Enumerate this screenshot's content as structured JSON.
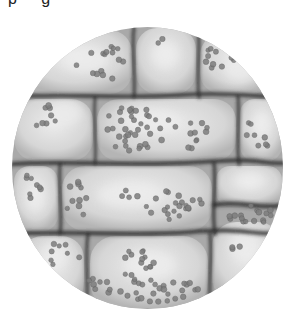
{
  "caption_remnant": "p g",
  "image": {
    "subject": "micrograph of plant leaf cells with chloroplasts",
    "view": "circular microscope field",
    "field": {
      "cx": 147.5,
      "cy": 168,
      "rx": 135.5,
      "ry": 141
    },
    "colors": {
      "background": "#ffffff",
      "cytoplasm": "#a9a9a9",
      "cell_interior": "#d6d6d6",
      "cell_highlight": "#ececec",
      "wall": "#2e2e2e",
      "chloroplast": "#7d7d7d",
      "chloroplast_edge": "#5e5e5e"
    },
    "cells": [
      {
        "x": 20,
        "y": 30,
        "w": 112,
        "h": 64,
        "glow": [
          85,
          60
        ]
      },
      {
        "x": 136,
        "y": 28,
        "w": 60,
        "h": 66,
        "glow": [
          165,
          55
        ]
      },
      {
        "x": 200,
        "y": 34,
        "w": 72,
        "h": 60,
        "glow": [
          240,
          70
        ]
      },
      {
        "x": 14,
        "y": 99,
        "w": 79,
        "h": 62,
        "glow": [
          65,
          113
        ]
      },
      {
        "x": 97,
        "y": 99,
        "w": 139,
        "h": 62,
        "glow": [
          150,
          120
        ]
      },
      {
        "x": 240,
        "y": 99,
        "w": 42,
        "h": 62,
        "glow": [
          262,
          125
        ]
      },
      {
        "x": 14,
        "y": 166,
        "w": 44,
        "h": 65,
        "glow": [
          35,
          200
        ]
      },
      {
        "x": 62,
        "y": 166,
        "w": 150,
        "h": 65,
        "glow": [
          130,
          195
        ]
      },
      {
        "x": 216,
        "y": 166,
        "w": 66,
        "h": 40,
        "glow": [
          250,
          180
        ]
      },
      {
        "x": 20,
        "y": 236,
        "w": 64,
        "h": 70,
        "glow": [
          55,
          255
        ]
      },
      {
        "x": 90,
        "y": 236,
        "w": 118,
        "h": 72,
        "glow": [
          150,
          265
        ]
      },
      {
        "x": 212,
        "y": 222,
        "w": 70,
        "h": 80,
        "glow": [
          245,
          245
        ]
      }
    ],
    "walls": [
      {
        "d": "M12 97 C 60 93, 120 99, 180 95 S 260 98, 285 97",
        "w": 4
      },
      {
        "d": "M12 164 C 70 160, 130 167, 200 162 S 260 165, 285 163",
        "w": 4.5
      },
      {
        "d": "M12 234 C 70 230, 130 237, 190 232 S 250 236, 285 233",
        "w": 4.5
      },
      {
        "d": "M134 27 C 131 50, 136 75, 134 97",
        "w": 3
      },
      {
        "d": "M198 27 C 201 50, 196 75, 199 97",
        "w": 3
      },
      {
        "d": "M95 97 C 93 120, 97 145, 95 164",
        "w": 2.5
      },
      {
        "d": "M238 97 C 240 120, 236 145, 239 164",
        "w": 3
      },
      {
        "d": "M60 164 C 58 185, 63 210, 60 234",
        "w": 3
      },
      {
        "d": "M214 164 C 217 185, 211 210, 215 234",
        "w": 3.5
      },
      {
        "d": "M88 234 C 84 260, 90 285, 86 309",
        "w": 3
      },
      {
        "d": "M210 234 C 213 260, 207 285, 211 309",
        "w": 3
      },
      {
        "d": "M214 205 C 240 200, 260 210, 285 205",
        "w": 5
      }
    ],
    "chloroplast_clusters": [
      {
        "cx": 100,
        "cy": 62,
        "rx": 28,
        "ry": 20,
        "n": 16
      },
      {
        "cx": 165,
        "cy": 40,
        "rx": 10,
        "ry": 6,
        "n": 2
      },
      {
        "cx": 222,
        "cy": 60,
        "rx": 22,
        "ry": 18,
        "n": 14
      },
      {
        "cx": 42,
        "cy": 115,
        "rx": 16,
        "ry": 12,
        "n": 8
      },
      {
        "cx": 140,
        "cy": 128,
        "rx": 40,
        "ry": 24,
        "n": 38
      },
      {
        "cx": 195,
        "cy": 135,
        "rx": 16,
        "ry": 15,
        "n": 10
      },
      {
        "cx": 258,
        "cy": 135,
        "rx": 14,
        "ry": 18,
        "n": 8
      },
      {
        "cx": 30,
        "cy": 190,
        "rx": 12,
        "ry": 18,
        "n": 8
      },
      {
        "cx": 75,
        "cy": 200,
        "rx": 14,
        "ry": 22,
        "n": 10
      },
      {
        "cx": 175,
        "cy": 205,
        "rx": 30,
        "ry": 16,
        "n": 22
      },
      {
        "cx": 130,
        "cy": 195,
        "rx": 10,
        "ry": 8,
        "n": 4
      },
      {
        "cx": 250,
        "cy": 215,
        "rx": 24,
        "ry": 10,
        "n": 16
      },
      {
        "cx": 60,
        "cy": 255,
        "rx": 20,
        "ry": 12,
        "n": 8
      },
      {
        "cx": 140,
        "cy": 265,
        "rx": 18,
        "ry": 20,
        "n": 16
      },
      {
        "cx": 160,
        "cy": 290,
        "rx": 40,
        "ry": 12,
        "n": 26
      },
      {
        "cx": 100,
        "cy": 285,
        "rx": 16,
        "ry": 12,
        "n": 8
      },
      {
        "cx": 230,
        "cy": 250,
        "rx": 12,
        "ry": 10,
        "n": 3
      }
    ],
    "chloroplast_radius": 2.6
  }
}
